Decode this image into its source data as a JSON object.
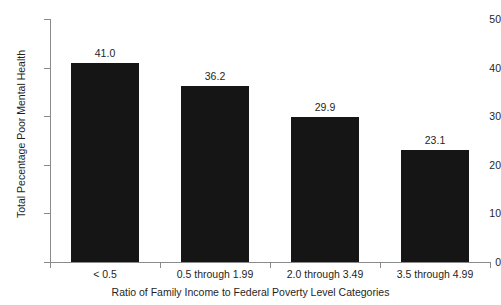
{
  "chart_data": {
    "type": "bar",
    "title": "",
    "subtitle": "",
    "xlabel": "Ratio of Family Income to Federal Poverty Level Categories",
    "ylabel": "Total Pecentage Poor Mental Health",
    "categories": [
      "< 0.5",
      "0.5 through 1.99",
      "2.0 through 3.49",
      "3.5 through 4.99"
    ],
    "values": [
      41.0,
      36.2,
      29.9,
      23.1
    ],
    "value_labels": [
      "41.0",
      "36.2",
      "29.9",
      "23.1"
    ],
    "ylim": [
      0,
      50
    ],
    "ytick_values": [
      0,
      10,
      20,
      30,
      40,
      50
    ],
    "ytick_labels": [
      "0",
      "10",
      "20",
      "30",
      "40",
      "50"
    ],
    "grid": false,
    "legend": false,
    "legend_position": "none",
    "bar_color": "#151515",
    "axis_color": "#8a8a8a",
    "background_color": "#ffffff",
    "text_color": "#1f1f1f"
  }
}
